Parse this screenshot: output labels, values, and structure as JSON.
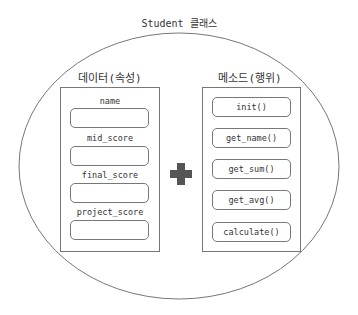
{
  "diagram": {
    "title": "Student 클래스",
    "data_section": {
      "title": "데이터(속성)",
      "attributes": [
        "name",
        "mid_score",
        "final_score",
        "project_score"
      ]
    },
    "method_section": {
      "title": "메소드(행위)",
      "methods": [
        "init()",
        "get_name()",
        "get_sum()",
        "get_avg()",
        "calculate()"
      ]
    },
    "connector": "plus-icon",
    "colors": {
      "stroke": "#777777",
      "plus": "#555555"
    }
  }
}
